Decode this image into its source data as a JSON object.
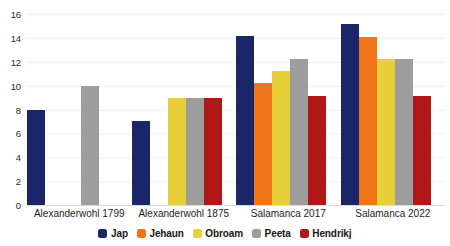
{
  "chart_data": {
    "type": "bar",
    "title": "",
    "subtitle": "",
    "xlabel": "",
    "ylabel": "",
    "ylim": [
      0,
      16
    ],
    "ytick_step": 2,
    "yticks": [
      "16",
      "14",
      "12",
      "10",
      "8",
      "6",
      "4",
      "2",
      "0"
    ],
    "grid": true,
    "grid_axis": "y",
    "legend_position": "bottom-center",
    "categories": [
      "Alexanderwohl 1799",
      "Alexanderwohl 1875",
      "Salamanca 2017",
      "Salamanca 2022"
    ],
    "series": [
      {
        "name": "Jap",
        "color": "#1a2668",
        "values": [
          8,
          7,
          14.2,
          15.2
        ]
      },
      {
        "name": "Jehaun",
        "color": "#ef7518",
        "values": [
          null,
          null,
          10.2,
          14.1
        ]
      },
      {
        "name": "Obroam",
        "color": "#e8cf3a",
        "values": [
          null,
          9,
          11.2,
          12.2
        ]
      },
      {
        "name": "Peeta",
        "color": "#9d9d9d",
        "values": [
          10,
          9,
          12.2,
          12.2
        ]
      },
      {
        "name": "Hendrikj",
        "color": "#b01717",
        "values": [
          null,
          9,
          9.1,
          9.1
        ]
      }
    ]
  },
  "legend": {
    "items": [
      {
        "label": "Jap",
        "color": "#1a2668"
      },
      {
        "label": "Jehaun",
        "color": "#ef7518"
      },
      {
        "label": "Obroam",
        "color": "#e8cf3a"
      },
      {
        "label": "Peeta",
        "color": "#9d9d9d"
      },
      {
        "label": "Hendrikj",
        "color": "#b01717"
      }
    ]
  }
}
